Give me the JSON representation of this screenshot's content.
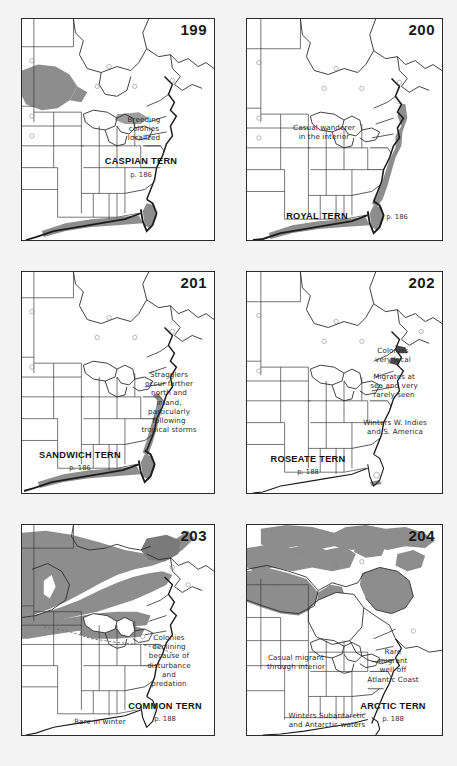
{
  "document": {
    "type": "field-guide-range-map-plate",
    "background_color": "#f2f2f2",
    "panel_background": "#ffffff",
    "range_shade_color": "#8d8d8d",
    "outline_color": "#2b2b2b",
    "coast_color": "#1c1c1c"
  },
  "panels": [
    {
      "number": "199",
      "species": "CASPIAN TERN",
      "page": "p. 186",
      "notes": [
        {
          "text": "Breeding\ncolonies\nlocalized",
          "x": 118,
          "y": 104
        }
      ],
      "species_pos": {
        "x": 100,
        "y": 144
      },
      "page_pos": {
        "x": 122,
        "y": 157
      },
      "shading": "breeding range in north-central plains and Great Lakes; wintering along Gulf and Florida coasts"
    },
    {
      "number": "200",
      "species": "ROYAL TERN",
      "page": "p. 186",
      "notes": [
        {
          "text": "Casual wanderer\nin the interior",
          "x": 58,
          "y": 110
        }
      ],
      "species_pos": {
        "x": 62,
        "y": 197
      },
      "page_pos": {
        "x": 150,
        "y": 199
      },
      "shading": "coastal band along Atlantic and Gulf coasts, Florida"
    },
    {
      "number": "201",
      "species": "SANDWICH TERN",
      "page": "p. 186",
      "notes": [
        {
          "text": "Stragglers\noccur farther\nnorth and\ninland,\nparticularly\nfollowing\ntropical storms",
          "x": 130,
          "y": 110
        }
      ],
      "species_pos": {
        "x": 40,
        "y": 183
      },
      "page_pos": {
        "x": 70,
        "y": 196
      },
      "shading": "coastal band along Gulf coast and southeast Atlantic coast"
    },
    {
      "number": "202",
      "species": "ROSEATE TERN",
      "page": "p. 188",
      "notes": [
        {
          "text": "Colonies\nvery local",
          "x": 132,
          "y": 82
        },
        {
          "text": "Migrates at\nsea and very\nrarely seen",
          "x": 132,
          "y": 107
        },
        {
          "text": "Winters W. Indies\nand S. America",
          "x": 128,
          "y": 152
        }
      ],
      "species_pos": {
        "x": 48,
        "y": 187
      },
      "page_pos": {
        "x": 76,
        "y": 200
      },
      "shading": "small coastal colonies on New England coast"
    },
    {
      "number": "203",
      "species": "COMMON TERN",
      "page": "p. 188",
      "notes": [
        {
          "text": "Colonies\ndeclining\nbecause of\ndisturbance\nand\npredation",
          "x": 132,
          "y": 116
        },
        {
          "text": "Rare in winter",
          "x": 38,
          "y": 196
        }
      ],
      "species_pos": {
        "x": 112,
        "y": 182
      },
      "page_pos": {
        "x": 141,
        "y": 195
      },
      "shading": "broad breeding range across central and eastern Canada and northern U.S.; dashed winter limit line"
    },
    {
      "number": "204",
      "species": "ARCTIC TERN",
      "page": "p. 188",
      "notes": [
        {
          "text": "Casual migrant\nthrough interior",
          "x": 34,
          "y": 134
        },
        {
          "text": "Rare\nmigrant\nwell off\nAtlantic Coast",
          "x": 125,
          "y": 130
        },
        {
          "text": "Winters Subantarctic\nand Antarctic waters",
          "x": 52,
          "y": 193
        }
      ],
      "species_pos": {
        "x": 125,
        "y": 182
      },
      "page_pos": {
        "x": 152,
        "y": 195
      },
      "shading": "arctic Canada, Hudson Bay, Labrador and high arctic islands"
    }
  ]
}
